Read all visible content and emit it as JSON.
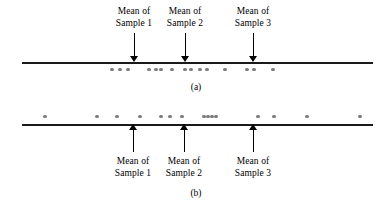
{
  "figure": {
    "line_color": "#1a1a1a",
    "dot_color": "#7d7d7d",
    "arrow_color": "#000000"
  },
  "panels": [
    {
      "id": "a",
      "caption": "(a)",
      "line": {
        "x1": 22,
        "x2": 373,
        "y": 62
      },
      "dots_position": "below-line",
      "dots_y": 68,
      "dots_x": [
        112,
        120,
        128,
        149,
        156,
        161,
        172,
        185,
        191,
        200,
        207,
        225,
        247,
        254,
        273
      ],
      "arrows_direction": "down",
      "labels_position": "above",
      "annotations": [
        {
          "x": 134,
          "line1": "Mean of",
          "line2": "Sample 1",
          "arrow_top": 33,
          "arrow_bottom": 62,
          "label_top": 6
        },
        {
          "x": 185,
          "line1": "Mean of",
          "line2": "Sample 2",
          "arrow_top": 33,
          "arrow_bottom": 62,
          "label_top": 6
        },
        {
          "x": 253,
          "line1": "Mean of",
          "line2": "Sample 3",
          "arrow_top": 33,
          "arrow_bottom": 62,
          "label_top": 6
        }
      ]
    },
    {
      "id": "b",
      "caption": "(b)",
      "line": {
        "x1": 22,
        "x2": 373,
        "y": 124
      },
      "dots_position": "above-line",
      "dots_y": 115,
      "dots_x": [
        45,
        97,
        117,
        140,
        161,
        170,
        182,
        204,
        208,
        212,
        216,
        258,
        274,
        307,
        360
      ],
      "arrows_direction": "up",
      "labels_position": "below",
      "annotations": [
        {
          "x": 133,
          "line1": "Mean of",
          "line2": "Sample 1",
          "arrow_top": 124,
          "arrow_bottom": 152,
          "label_top": 156
        },
        {
          "x": 184,
          "line1": "Mean of",
          "line2": "Sample 2",
          "arrow_top": 124,
          "arrow_bottom": 152,
          "label_top": 156
        },
        {
          "x": 253,
          "line1": "Mean of",
          "line2": "Sample 3",
          "arrow_top": 124,
          "arrow_bottom": 152,
          "label_top": 156
        }
      ]
    }
  ],
  "captions": [
    {
      "text": "(a)",
      "x": 196,
      "y": 82
    },
    {
      "text": "(b)",
      "x": 196,
      "y": 188
    }
  ]
}
